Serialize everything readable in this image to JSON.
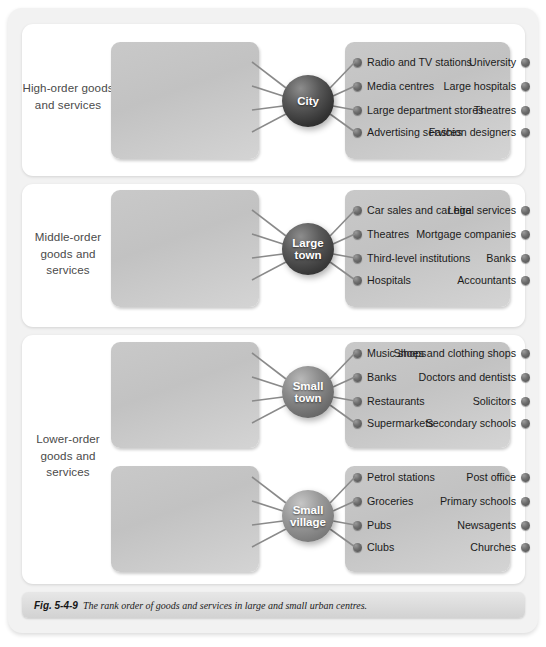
{
  "figure": {
    "caption_number": "Fig. 5-4-9",
    "caption_text": "The rank order of goods and services in large and small urban centres."
  },
  "colors": {
    "frame_background": "#f2f2f2",
    "panel_background": "#ffffff",
    "cluster_box": "#c6c6c6",
    "hub_city": "#333333",
    "hub_large_town": "#3a3a3a",
    "hub_small_town": "#6c6c6c",
    "hub_small_village": "#7e7e7e",
    "dot": "#5a5a5a"
  },
  "sections": [
    {
      "rank_label": "High-order goods and services",
      "groups": [
        {
          "hub": "City",
          "hub_lines": [
            "City"
          ],
          "left_items": [
            "University",
            "Large hospitals",
            "Theatres",
            "Fashion designers"
          ],
          "right_items": [
            "Radio and TV stations",
            "Media centres",
            "Large department stores",
            "Advertising services"
          ]
        }
      ]
    },
    {
      "rank_label": "Middle-order goods and services",
      "groups": [
        {
          "hub": "Large town",
          "hub_lines": [
            "Large",
            "town"
          ],
          "left_items": [
            "Legal services",
            "Mortgage companies",
            "Banks",
            "Accountants"
          ],
          "right_items": [
            "Car sales and car hire",
            "Theatres",
            "Third-level institutions",
            "Hospitals"
          ]
        }
      ]
    },
    {
      "rank_label": "Lower-order goods and services",
      "groups": [
        {
          "hub": "Small town",
          "hub_lines": [
            "Small",
            "town"
          ],
          "left_items": [
            "Shoes and clothing shops",
            "Doctors and dentists",
            "Solicitors",
            "Secondary schools"
          ],
          "right_items": [
            "Music shops",
            "Banks",
            "Restaurants",
            "Supermarkets"
          ]
        },
        {
          "hub": "Small village",
          "hub_lines": [
            "Small",
            "village"
          ],
          "left_items": [
            "Post office",
            "Primary schools",
            "Newsagents",
            "Churches"
          ],
          "right_items": [
            "Petrol stations",
            "Groceries",
            "Pubs",
            "Clubs"
          ]
        }
      ]
    }
  ]
}
